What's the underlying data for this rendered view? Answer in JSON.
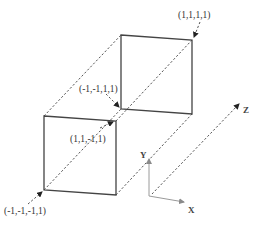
{
  "diagram": {
    "type": "4D hypercube slice projection (two squares connected along Z)",
    "vertex_labels": {
      "top_right_back": "(1,1,1,1)",
      "bottom_left_back": "(-1,-1,1,1)",
      "top_right_front": "(1,1,-1,1)",
      "bottom_left_front": "(-1,-1,-1,1)"
    },
    "axes": {
      "x": "X",
      "y": "Y",
      "z": "Z"
    },
    "colors": {
      "square_stroke": "#444444",
      "dashed_stroke": "#555555",
      "axis_stroke": "#9a9a9a",
      "text": "#333333"
    }
  }
}
